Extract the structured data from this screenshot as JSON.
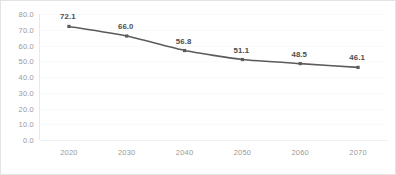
{
  "chart_data": {
    "type": "line",
    "title": "",
    "subtitle": "",
    "xlabel": "",
    "ylabel": "",
    "categories": [
      "2020",
      "2030",
      "2040",
      "2050",
      "2060",
      "2070"
    ],
    "values": [
      72.1,
      66.0,
      56.8,
      51.1,
      48.5,
      46.1
    ],
    "data_labels": [
      "72.1",
      "66.0",
      "56.8",
      "51.1",
      "48.5",
      "46.1"
    ],
    "series": [
      {
        "name": "",
        "values": [
          72.1,
          66.0,
          56.8,
          51.1,
          48.5,
          46.1
        ]
      }
    ],
    "ylim": [
      0.0,
      80.0
    ],
    "ytick_step": 10.0,
    "ytick_labels": [
      "80.0",
      "70.0",
      "60.0",
      "50.0",
      "40.0",
      "30.0",
      "20.0",
      "10.0",
      "0.0"
    ],
    "ytick_values": [
      80.0,
      70.0,
      60.0,
      50.0,
      40.0,
      30.0,
      20.0,
      10.0,
      0.0
    ],
    "xtick_labels": [
      "2020",
      "2030",
      "2040",
      "2050",
      "2060",
      "2070"
    ],
    "grid": true,
    "grid_axis": "y",
    "legend": false,
    "legend_position": "none",
    "line_color": "#5b5b5b",
    "marker_color": "#5b5b5b",
    "marker_shape": "square",
    "label_color": "#4d4d4d",
    "tick_color": "#9a9a9a",
    "grid_color": "#fafafa",
    "border_color": "#e3e3e3",
    "background_color": "#ffffff",
    "smooth": true
  }
}
